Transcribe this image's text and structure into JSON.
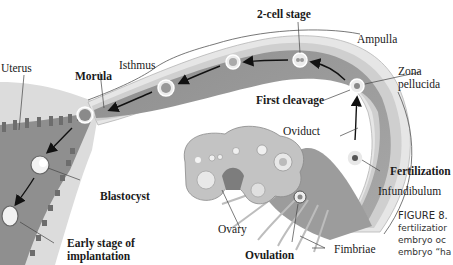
{
  "diagram": {
    "type": "anatomical-pathway",
    "colors": {
      "tube_outer": "#e8e8e8",
      "tube_wall": "#c9c9c9",
      "lumen": "#9a9a9a",
      "uterus_tissue": "#d8d8d8",
      "ovary": "#c4c4c4",
      "cell_fill": "#f4f4f4",
      "arrow": "#111111"
    },
    "labels": {
      "two_cell_stage": "2-cell stage",
      "ampulla": "Ampulla",
      "uterus": "Uterus",
      "isthmus": "Isthmus",
      "morula": "Morula",
      "zona_pellucida_1": "Zona",
      "zona_pellucida_2": "pellucida",
      "first_cleavage": "First cleavage",
      "oviduct": "Oviduct",
      "fertilization": "Fertilization",
      "infundibulum": "Infundibulum",
      "blastocyst": "Blastocyst",
      "ovary": "Ovary",
      "early_stage_1": "Early stage of",
      "early_stage_2": "implantation",
      "ovulation": "Ovulation",
      "fimbriae": "Fimbriae"
    },
    "caption": {
      "title": "FIGURE 8.",
      "line1": "fertilizatior",
      "line2": "embryo oc",
      "line3": "embryo “ha"
    }
  }
}
